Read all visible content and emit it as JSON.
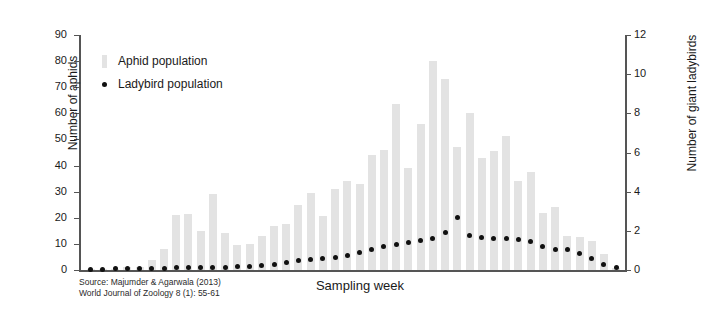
{
  "chart_data": {
    "type": "bar",
    "title": "",
    "xlabel": "Sampling week",
    "ylabel": "Number of aphids",
    "ylabel_secondary": "Number of giant ladybirds",
    "ylim": [
      0,
      90
    ],
    "ylim_secondary": [
      0,
      12
    ],
    "yticks": [
      0,
      10,
      20,
      30,
      40,
      50,
      60,
      70,
      80,
      90
    ],
    "yticks_secondary": [
      0,
      2,
      4,
      6,
      8,
      10,
      12
    ],
    "grid": false,
    "legend_position": "top-left",
    "legend": [
      "Aphid population",
      "Ladybird population"
    ],
    "categories": [
      1,
      2,
      3,
      4,
      5,
      6,
      7,
      8,
      9,
      10,
      11,
      12,
      13,
      14,
      15,
      16,
      17,
      18,
      19,
      20,
      21,
      22,
      23,
      24,
      25,
      26,
      27,
      28,
      29,
      30,
      31,
      32,
      33,
      34,
      35,
      36,
      37,
      38,
      39,
      40,
      41,
      42,
      43,
      44
    ],
    "series": [
      {
        "name": "Aphid population",
        "axis": "left",
        "color": "#e3e3e3",
        "values": [
          0.4,
          0.4,
          0.5,
          1.0,
          1.2,
          4.0,
          8.0,
          21.0,
          21.5,
          15.0,
          29.0,
          14.0,
          9.5,
          10.0,
          13.0,
          17.0,
          17.5,
          25.0,
          29.5,
          20.5,
          31.0,
          34.0,
          33.0,
          44.0,
          46.0,
          63.5,
          39.0,
          56.0,
          80.0,
          73.0,
          47.0,
          60.0,
          43.0,
          45.5,
          51.5,
          34.0,
          37.5,
          22.0,
          24.0,
          13.0,
          12.5,
          11.0,
          6.0,
          0.8
        ]
      },
      {
        "name": "Ladybird population",
        "axis": "right",
        "color": "#111111",
        "values": [
          0.05,
          0.05,
          0.06,
          0.08,
          0.08,
          0.1,
          0.1,
          0.12,
          0.12,
          0.14,
          0.15,
          0.15,
          0.16,
          0.2,
          0.25,
          0.3,
          0.4,
          0.5,
          0.55,
          0.6,
          0.65,
          0.75,
          0.9,
          1.05,
          1.2,
          1.3,
          1.4,
          1.5,
          1.6,
          1.9,
          2.7,
          1.75,
          1.65,
          1.6,
          1.6,
          1.55,
          1.45,
          1.2,
          1.05,
          1.05,
          0.85,
          0.6,
          0.3,
          0.12
        ]
      }
    ]
  },
  "source": {
    "line1": "Source: Majumder & Agarwala (2013)",
    "line2": "World Journal of Zoology 8 (1): 55-61"
  }
}
